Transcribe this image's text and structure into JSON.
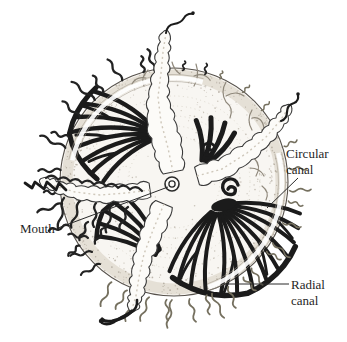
{
  "figure": {
    "labels": {
      "mouth": "Mouth",
      "circular_canal": {
        "line1": "Circular",
        "line2": "canal"
      },
      "radial_canal": {
        "line1": "Radial",
        "line2": "canal"
      }
    },
    "colors": {
      "ink": "#1b1b1b",
      "label_text": "#1f1f1f",
      "leader": "#2a2a2a",
      "paper": "#ffffff",
      "bell_fill": "#f8f6f2",
      "margin_band": "#e2dcd1",
      "stipple_dot": "#aaa295",
      "stipple_ring": "#c9c2b5",
      "pale_canal": "#8f887b",
      "canal_band": "#ffffff",
      "canal_band_edge": "#a29a8d",
      "tentacle_dark": "#222222",
      "tentacle_gray": "#75705f",
      "arm_fill": "#fcfbf8",
      "arm_stroke": "#3a3a3a",
      "arm_texture": "#cfc8bb"
    }
  }
}
